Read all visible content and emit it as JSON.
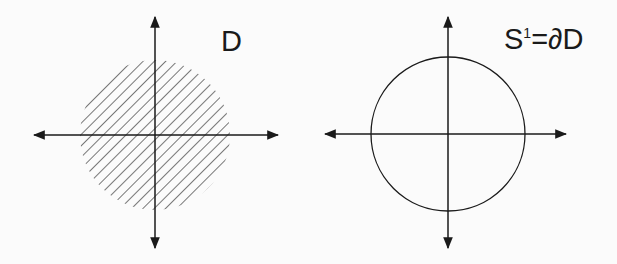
{
  "figures": [
    {
      "name": "disk",
      "label": "D",
      "description": "filled disk (hatched)",
      "center": [
        155,
        135
      ],
      "radius": 75,
      "fill": "hatched"
    },
    {
      "name": "circle",
      "label_base": "S",
      "label_sup": "1",
      "label_rest": "=∂D",
      "description": "circle boundary of disk",
      "center": [
        448,
        135
      ],
      "radius": 77,
      "fill": "none"
    }
  ],
  "colors": {
    "stroke": "#1a1a1a",
    "hatch": "#555555",
    "background": "#fbfbfb"
  }
}
